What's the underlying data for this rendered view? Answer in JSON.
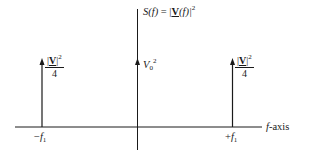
{
  "diagram": {
    "title": {
      "lhs_func": "S",
      "lhs_arg": "(f)",
      "equals": " = |",
      "rhs_var": "V",
      "rhs_arg": "(f)|",
      "rhs_exp": "2"
    },
    "axis": {
      "label_var": "f",
      "label_suffix": "-axis"
    },
    "impulses": [
      {
        "id": "left",
        "position_label_sign": "−",
        "position_label_var": "f",
        "position_label_sub": "1",
        "magnitude_num_open": "|",
        "magnitude_num_var": "V",
        "magnitude_num_close": "|",
        "magnitude_num_exp": "2",
        "magnitude_den": "4"
      },
      {
        "id": "center",
        "magnitude_var": "V",
        "magnitude_sub": "0",
        "magnitude_exp": "2"
      },
      {
        "id": "right",
        "position_label_sign": "+",
        "position_label_var": "f",
        "position_label_sub": "1",
        "magnitude_num_open": "|",
        "magnitude_num_var": "V",
        "magnitude_num_close": "|",
        "magnitude_num_exp": "2",
        "magnitude_den": "4"
      }
    ],
    "colors": {
      "stroke": "#1a1a1a",
      "background": "#ffffff"
    }
  }
}
